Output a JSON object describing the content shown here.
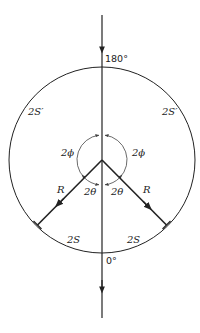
{
  "diagram": {
    "type": "geometric-construction",
    "colors": {
      "stroke": "#222222",
      "thin_stroke": "#444444",
      "background": "#ffffff"
    },
    "labels": {
      "top_angle": "180°",
      "bottom_angle": "0°",
      "upper_left_arc": "2S′",
      "upper_right_arc": "2S′",
      "lower_left_arc": "2S",
      "lower_right_arc": "2S",
      "left_phi": "2ϕ",
      "right_phi": "2ϕ",
      "left_theta": "2θ",
      "right_theta": "2θ",
      "left_radius": "R",
      "right_radius": "R"
    },
    "geometry": {
      "center": [
        102,
        160
      ],
      "large_circle_radius": 93,
      "small_circle_radius": 25,
      "radius_angle_from_vertical_deg": 45,
      "vertical_line": {
        "y_start": 15,
        "y_end": 318
      }
    }
  }
}
